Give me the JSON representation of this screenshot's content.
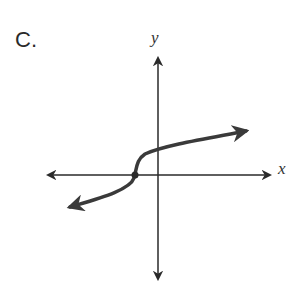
{
  "option_label": "C.",
  "axes": {
    "x_label": "x",
    "y_label": "y"
  },
  "graph": {
    "description": "Cube-root-like curve with inflection point on negative x-axis, increasing, arrows on both ends",
    "point": {
      "shape": "closed-dot",
      "location": "on negative x-axis"
    },
    "colors": {
      "curve": "#3a3a3a",
      "axes": "#2a2a2a"
    }
  }
}
